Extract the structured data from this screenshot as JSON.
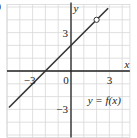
{
  "panel_label": ")",
  "chart_data": {
    "type": "line",
    "title": "",
    "xlabel": "x",
    "ylabel": "y",
    "function_label": "y = f(x)",
    "xlim": [
      -5,
      4.6
    ],
    "ylim": [
      -5.2,
      5.2
    ],
    "grid": true,
    "grid_step": 1,
    "x_ticks": [
      {
        "value": -3,
        "label": "−3"
      },
      {
        "value": 0,
        "label": "0"
      },
      {
        "value": 3,
        "label": "3"
      }
    ],
    "y_ticks": [
      {
        "value": 3,
        "label": "3"
      },
      {
        "value": -3,
        "label": "−3"
      }
    ],
    "series": [
      {
        "name": "y = f(x)",
        "equation": "y = x + 2",
        "slope": 1,
        "intercept": 2,
        "x": [
          -4.85,
          2.9
        ],
        "y": [
          -2.85,
          4.9
        ]
      }
    ],
    "annotations": [
      {
        "type": "open_circle",
        "x": 2,
        "y": 4
      }
    ],
    "colors": {
      "grid": "#d8d8d8",
      "axes": "#222222",
      "line": "#333333",
      "text": "#222222"
    }
  }
}
